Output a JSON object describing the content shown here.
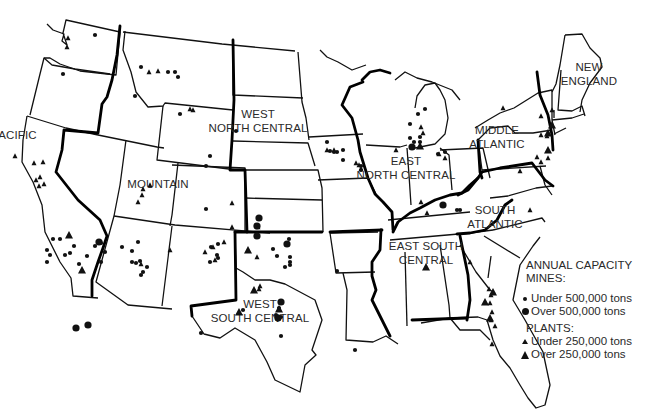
{
  "map": {
    "title": "Annual capacity of mines and plants by US census region",
    "regions": [
      {
        "name": "PACIFIC",
        "lines": [
          "PACIFIC"
        ],
        "x": 14,
        "y": 139
      },
      {
        "name": "MOUNTAIN",
        "lines": [
          "MOUNTAIN"
        ],
        "x": 158,
        "y": 188
      },
      {
        "name": "WEST NORTH CENTRAL",
        "lines": [
          "WEST",
          "NORTH CENTRAL"
        ],
        "x": 258,
        "y": 118
      },
      {
        "name": "EAST NORTH CENTRAL",
        "lines": [
          "EAST",
          "NORTH CENTRAL"
        ],
        "x": 406,
        "y": 165
      },
      {
        "name": "WEST SOUTH CENTRAL",
        "lines": [
          "WEST",
          "SOUTH CENTRAL"
        ],
        "x": 260,
        "y": 308
      },
      {
        "name": "EAST SOUTH CENTRAL",
        "lines": [
          "EAST SOUTH",
          "CENTRAL"
        ],
        "x": 426,
        "y": 250
      },
      {
        "name": "SOUTH ATLANTIC",
        "lines": [
          "SOUTH",
          "ATLANTIC"
        ],
        "x": 495,
        "y": 214
      },
      {
        "name": "MIDDLE ATLANTIC",
        "lines": [
          "MIDDLE",
          "ATLANTIC"
        ],
        "x": 497,
        "y": 134
      },
      {
        "name": "NEW ENGLAND",
        "lines": [
          "NEW",
          "ENGLAND"
        ],
        "x": 589,
        "y": 71
      }
    ]
  },
  "legend": {
    "title": "ANNUAL CAPACITY",
    "mines_header": "MINES:",
    "mines": [
      {
        "symbol": "small-dot",
        "label": "Under 500,000 tons"
      },
      {
        "symbol": "large-dot",
        "label": "Over 500,000 tons"
      }
    ],
    "plants_header": "PLANTS:",
    "plants": [
      {
        "symbol": "small-triangle",
        "label": "Under 250,000 tons"
      },
      {
        "symbol": "large-triangle",
        "label": "Over 250,000 tons"
      }
    ]
  },
  "markers": {
    "mines_small": [
      [
        95,
        35
      ],
      [
        168,
        72
      ],
      [
        175,
        72
      ],
      [
        178,
        77
      ],
      [
        135,
        96
      ],
      [
        180,
        114
      ],
      [
        210,
        156
      ],
      [
        206,
        166
      ],
      [
        206,
        209
      ],
      [
        236,
        131
      ],
      [
        327,
        142
      ],
      [
        330,
        151
      ],
      [
        334,
        152
      ],
      [
        343,
        150
      ],
      [
        337,
        152
      ],
      [
        343,
        160
      ],
      [
        361,
        166
      ],
      [
        361,
        170
      ],
      [
        410,
        124
      ],
      [
        425,
        109
      ],
      [
        418,
        114
      ],
      [
        420,
        137
      ],
      [
        420,
        142
      ],
      [
        410,
        138
      ],
      [
        414,
        142
      ],
      [
        445,
        152
      ],
      [
        438,
        154
      ],
      [
        457,
        210
      ],
      [
        460,
        210
      ],
      [
        53,
        239
      ],
      [
        60,
        239
      ],
      [
        47,
        250
      ],
      [
        50,
        255
      ],
      [
        65,
        255
      ],
      [
        70,
        253
      ],
      [
        74,
        246
      ],
      [
        87,
        256
      ],
      [
        95,
        246
      ],
      [
        105,
        252
      ],
      [
        79,
        264
      ],
      [
        101,
        262
      ],
      [
        138,
        242
      ],
      [
        140,
        261
      ],
      [
        143,
        272
      ],
      [
        141,
        275
      ],
      [
        147,
        267
      ],
      [
        218,
        244
      ],
      [
        211,
        247
      ],
      [
        218,
        258
      ],
      [
        217,
        255
      ],
      [
        210,
        262
      ],
      [
        289,
        239
      ],
      [
        273,
        249
      ],
      [
        277,
        256
      ],
      [
        290,
        257
      ],
      [
        290,
        262
      ],
      [
        290,
        265
      ],
      [
        285,
        267
      ],
      [
        279,
        308
      ],
      [
        276,
        315
      ],
      [
        281,
        317
      ],
      [
        281,
        336
      ],
      [
        243,
        310
      ],
      [
        201,
        333
      ],
      [
        337,
        271
      ],
      [
        355,
        350
      ],
      [
        141,
        67
      ],
      [
        122,
        247
      ],
      [
        132,
        251
      ],
      [
        132,
        262
      ],
      [
        136,
        263
      ],
      [
        47,
        262
      ],
      [
        101,
        243
      ],
      [
        63,
        74
      ]
    ],
    "mines_large": [
      [
        99,
        242
      ],
      [
        88,
        325
      ],
      [
        287,
        244
      ],
      [
        259,
        218
      ],
      [
        257,
        226
      ],
      [
        281,
        302
      ],
      [
        76,
        328
      ],
      [
        257,
        236
      ],
      [
        278,
        318
      ],
      [
        412,
        147
      ],
      [
        443,
        205
      ]
    ],
    "plants_small": [
      [
        68,
        38
      ],
      [
        67,
        47
      ],
      [
        149,
        72
      ],
      [
        158,
        71
      ],
      [
        190,
        109
      ],
      [
        193,
        110
      ],
      [
        143,
        189
      ],
      [
        150,
        185
      ],
      [
        142,
        195
      ],
      [
        138,
        202
      ],
      [
        141,
        264
      ],
      [
        170,
        250
      ],
      [
        205,
        252
      ],
      [
        213,
        247
      ],
      [
        224,
        242
      ],
      [
        232,
        203
      ],
      [
        258,
        227
      ],
      [
        259,
        289
      ],
      [
        257,
        257
      ],
      [
        260,
        286
      ],
      [
        232,
        227
      ],
      [
        215,
        260
      ],
      [
        334,
        150
      ],
      [
        327,
        150
      ],
      [
        356,
        163
      ],
      [
        359,
        165
      ],
      [
        361,
        169
      ],
      [
        396,
        150
      ],
      [
        421,
        127
      ],
      [
        423,
        133
      ],
      [
        439,
        154
      ],
      [
        445,
        158
      ],
      [
        421,
        202
      ],
      [
        427,
        213
      ],
      [
        470,
        262
      ],
      [
        489,
        289
      ],
      [
        491,
        295
      ],
      [
        490,
        303
      ],
      [
        492,
        312
      ],
      [
        491,
        320
      ],
      [
        495,
        326
      ],
      [
        492,
        344
      ],
      [
        503,
        108
      ],
      [
        541,
        116
      ],
      [
        552,
        110
      ],
      [
        541,
        135
      ],
      [
        547,
        136
      ],
      [
        537,
        157
      ],
      [
        548,
        158
      ],
      [
        541,
        162
      ],
      [
        520,
        171
      ],
      [
        530,
        210
      ],
      [
        39,
        186
      ],
      [
        44,
        184
      ],
      [
        36,
        180
      ],
      [
        40,
        177
      ],
      [
        15,
        156
      ],
      [
        34,
        163
      ],
      [
        43,
        162
      ]
    ],
    "plants_large": [
      [
        69,
        235
      ],
      [
        82,
        270
      ],
      [
        239,
        312
      ],
      [
        248,
        250
      ],
      [
        254,
        290
      ],
      [
        279,
        309
      ],
      [
        426,
        267
      ],
      [
        485,
        302
      ],
      [
        493,
        292
      ],
      [
        490,
        318
      ],
      [
        420,
        146
      ],
      [
        552,
        125
      ],
      [
        548,
        150
      ],
      [
        548,
        133
      ]
    ]
  }
}
